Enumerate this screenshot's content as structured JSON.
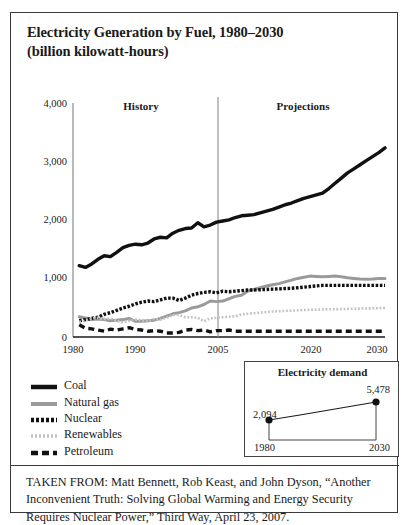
{
  "figure": {
    "title_line1": "Electricity Generation by Fuel, 1980–2030",
    "title_line2": "(billion kilowatt-hours)",
    "caption": "TAKEN FROM: Matt Bennett, Rob Keast, and John Dyson, “Another Inconvenient Truth: Solving Global Warming and Energy Security Requires Nuclear Power,” Third Way, April 23, 2007."
  },
  "colors": {
    "black": "#111111",
    "gray": "#9a9a9a",
    "light_gray": "#c2c2c2",
    "frame": "#3a3a3a"
  },
  "legend": {
    "items": [
      {
        "label": "Coal",
        "marker": "solid-thick-black"
      },
      {
        "label": "Natural gas",
        "marker": "solid-gray"
      },
      {
        "label": "Nuclear",
        "marker": "fine-dotted-black"
      },
      {
        "label": "Renewables",
        "marker": "fine-dotted-gray"
      },
      {
        "label": "Petroleum",
        "marker": "dashed-black"
      }
    ]
  },
  "annotations": {
    "history": "History",
    "projections": "Projections",
    "divider_year": 2005
  },
  "inset": {
    "title": "Electricity demand",
    "start_label": "2,094",
    "end_label": "5,478",
    "start_year": "1980",
    "end_year": "2030",
    "start_value": 2094,
    "end_value": 5478
  },
  "chart_data": {
    "type": "line",
    "title": "Electricity Generation by Fuel, 1980–2030",
    "subtitle": "(billion kilowatt-hours)",
    "xlabel": "",
    "ylabel": "billion kilowatt-hours",
    "xlim": [
      1980,
      2030
    ],
    "ylim": [
      0,
      4000
    ],
    "yticks": [
      0,
      1000,
      2000,
      3000,
      4000
    ],
    "ytick_labels": [
      "0",
      "1,000",
      "2,000",
      "3,000",
      "4,000"
    ],
    "xticks": [
      1980,
      1990,
      2005,
      2020,
      2030
    ],
    "xtick_labels": [
      "1980",
      "1990",
      "2005",
      "2020",
      "2030"
    ],
    "grid": false,
    "legend_position": "below-left",
    "x": [
      1981,
      1982,
      1983,
      1984,
      1985,
      1986,
      1987,
      1988,
      1989,
      1990,
      1991,
      1992,
      1993,
      1994,
      1995,
      1996,
      1997,
      1998,
      1999,
      2000,
      2001,
      2002,
      2003,
      2004,
      2005,
      2006,
      2007,
      2008,
      2009,
      2010,
      2011,
      2012,
      2013,
      2014,
      2015,
      2016,
      2017,
      2018,
      2019,
      2020,
      2021,
      2022,
      2023,
      2024,
      2025,
      2026,
      2027,
      2028,
      2029,
      2030
    ],
    "series": [
      {
        "name": "Coal",
        "style": "solid-thick-black",
        "color": "#111111",
        "values": [
          1230,
          1200,
          1260,
          1340,
          1400,
          1385,
          1460,
          1540,
          1580,
          1600,
          1590,
          1620,
          1690,
          1720,
          1710,
          1790,
          1840,
          1870,
          1880,
          1970,
          1900,
          1930,
          1980,
          2000,
          2020,
          2060,
          2090,
          2100,
          2110,
          2140,
          2170,
          2200,
          2240,
          2280,
          2310,
          2350,
          2390,
          2420,
          2450,
          2480,
          2560,
          2650,
          2740,
          2830,
          2900,
          2970,
          3040,
          3110,
          3180,
          3260
        ]
      },
      {
        "name": "Natural gas",
        "style": "solid-gray",
        "color": "#9a9a9a",
        "values": [
          350,
          330,
          300,
          310,
          300,
          280,
          290,
          300,
          320,
          270,
          270,
          280,
          290,
          320,
          360,
          400,
          420,
          450,
          500,
          520,
          560,
          620,
          610,
          620,
          660,
          700,
          720,
          790,
          820,
          850,
          880,
          900,
          920,
          950,
          980,
          1010,
          1030,
          1050,
          1045,
          1040,
          1045,
          1050,
          1040,
          1020,
          1010,
          1000,
          995,
          1000,
          1010,
          1010
        ]
      },
      {
        "name": "Nuclear",
        "style": "fine-dotted-black",
        "color": "#111111",
        "values": [
          280,
          300,
          320,
          340,
          390,
          420,
          460,
          500,
          530,
          570,
          600,
          620,
          610,
          640,
          670,
          670,
          630,
          670,
          720,
          750,
          770,
          780,
          760,
          790,
          780,
          790,
          800,
          810,
          810,
          815,
          820,
          825,
          830,
          835,
          840,
          850,
          860,
          870,
          880,
          890,
          890,
          890,
          890,
          890,
          890,
          890,
          890,
          890,
          890,
          890
        ]
      },
      {
        "name": "Renewables",
        "style": "fine-dotted-gray",
        "color": "#c2c2c2",
        "values": [
          260,
          280,
          320,
          330,
          310,
          320,
          280,
          250,
          280,
          300,
          290,
          270,
          310,
          300,
          330,
          380,
          380,
          340,
          340,
          330,
          270,
          320,
          330,
          340,
          350,
          360,
          390,
          400,
          410,
          420,
          430,
          440,
          445,
          450,
          455,
          460,
          465,
          470,
          470,
          475,
          478,
          480,
          482,
          485,
          488,
          490,
          492,
          495,
          498,
          500
        ]
      },
      {
        "name": "Petroleum",
        "style": "dashed-black",
        "color": "#111111",
        "values": [
          210,
          150,
          140,
          120,
          100,
          135,
          120,
          140,
          160,
          130,
          120,
          100,
          110,
          100,
          70,
          70,
          80,
          120,
          130,
          110,
          120,
          90,
          110,
          110,
          120,
          100,
          100,
          100,
          100,
          100,
          100,
          100,
          100,
          100,
          100,
          100,
          100,
          100,
          100,
          100,
          100,
          100,
          100,
          100,
          100,
          100,
          100,
          100,
          100,
          100
        ]
      }
    ]
  }
}
